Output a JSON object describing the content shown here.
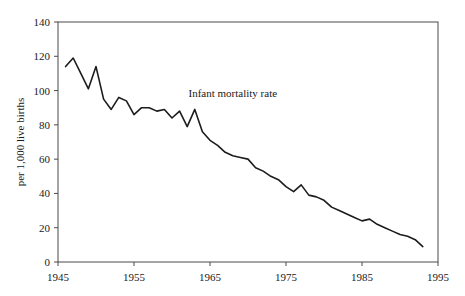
{
  "chart_data": {
    "type": "line",
    "title": "",
    "subtitle": "",
    "xlabel": "",
    "ylabel": "per 1,000 live births",
    "annotations": [
      {
        "text": "Infant mortality rate",
        "x": 1968,
        "y": 96
      }
    ],
    "legend": null,
    "legend_position": "none",
    "grid": false,
    "xlim": [
      1945,
      1995
    ],
    "ylim": [
      0,
      140
    ],
    "xticks": [
      1945,
      1955,
      1965,
      1975,
      1985,
      1995
    ],
    "xticklabels": [
      "1945",
      "1955",
      "1965",
      "1975",
      "1985",
      "1995"
    ],
    "yticks": [
      0,
      20,
      40,
      60,
      80,
      100,
      120,
      140
    ],
    "yticklabels": [
      "0",
      "20",
      "40",
      "60",
      "80",
      "100",
      "120",
      "140"
    ],
    "series": [
      {
        "name": "Infant mortality rate",
        "color": "#1c1c1c",
        "x": [
          1946,
          1947,
          1948,
          1949,
          1950,
          1951,
          1952,
          1953,
          1954,
          1955,
          1956,
          1957,
          1958,
          1959,
          1960,
          1961,
          1962,
          1963,
          1964,
          1965,
          1966,
          1967,
          1968,
          1969,
          1970,
          1971,
          1972,
          1973,
          1974,
          1975,
          1976,
          1977,
          1978,
          1979,
          1980,
          1981,
          1982,
          1983,
          1984,
          1985,
          1986,
          1987,
          1988,
          1989,
          1990,
          1991,
          1992,
          1993
        ],
        "values": [
          114,
          119,
          110,
          101,
          114,
          95,
          89,
          96,
          94,
          86,
          90,
          90,
          88,
          89,
          84,
          88,
          79,
          89,
          76,
          71,
          68,
          64,
          62,
          61,
          60,
          55,
          53,
          50,
          48,
          44,
          41,
          45,
          39,
          38,
          36,
          32,
          30,
          28,
          26,
          24,
          25,
          22,
          20,
          18,
          16,
          15,
          13,
          9
        ]
      }
    ],
    "geometry": {
      "plot_left": 58,
      "plot_right": 438,
      "plot_top": 22,
      "plot_bottom": 262
    }
  }
}
